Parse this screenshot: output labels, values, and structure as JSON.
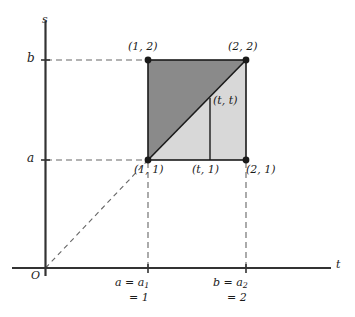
{
  "figure": {
    "kind": "math-diagram",
    "axes": {
      "t_axis_label": "t",
      "s_axis_label": "s",
      "origin_label": "O"
    },
    "ticks": {
      "s_lower": "a",
      "s_upper": "b",
      "t_lower_line1": "a = a",
      "t_lower_sub1": "1",
      "t_lower_line2": "= 1",
      "t_upper_line1": "b = a",
      "t_upper_sub1": "2",
      "t_upper_line2": "= 2"
    },
    "points": {
      "top_left": "(1, 2)",
      "top_right": "(2, 2)",
      "bottom_left": "(1, 1)",
      "bottom_mid": "(t, 1)",
      "bottom_right": "(2, 1)",
      "diagonal_point": "(t, t)"
    },
    "colors": {
      "upper_triangle_fill": "#8a8a8a",
      "lower_triangle_fill": "#d8d8d8",
      "stroke": "#1a1a1a",
      "dashed_stroke": "#555555",
      "background": "#ffffff"
    },
    "geometry": {
      "square_left_px": 148,
      "square_right_px": 246,
      "square_top_px": 60,
      "square_bottom_px": 160,
      "t_line_px": 210,
      "x_axis_y_px": 268,
      "y_axis_x_px": 45
    }
  }
}
